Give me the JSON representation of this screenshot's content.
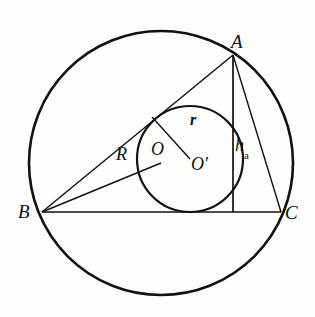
{
  "figure": {
    "background_color": "#fdfdfb",
    "stroke_color": "#111111"
  },
  "labels": {
    "vertex_a": "A",
    "vertex_b": "B",
    "vertex_c": "C",
    "circumcenter": "O",
    "incenter": "O′",
    "circumradius": "R",
    "inradius": "r",
    "altitude_h": "h",
    "altitude_sub": "a"
  },
  "geometry": {
    "circumcircle": {
      "cx": 161,
      "cy": 163,
      "r": 132,
      "stroke_width": 2.6
    },
    "incircle": {
      "cx": 190,
      "cy": 159,
      "r": 53,
      "stroke_width": 2.2
    },
    "points": {
      "A": {
        "x": 233,
        "y": 55
      },
      "B": {
        "x": 42,
        "y": 212
      },
      "C": {
        "x": 281,
        "y": 212
      },
      "O": {
        "x": 161,
        "y": 163
      },
      "Oprime": {
        "x": 190,
        "y": 159
      },
      "foot_of_altitude": {
        "x": 233,
        "y": 212
      },
      "tangent_point_ab": {
        "x": 152,
        "y": 117
      }
    },
    "segments": [
      {
        "name": "side-ab",
        "x1": 42,
        "y1": 212,
        "x2": 233,
        "y2": 55
      },
      {
        "name": "side-bc",
        "x1": 42,
        "y1": 212,
        "x2": 281,
        "y2": 212
      },
      {
        "name": "side-ac",
        "x1": 233,
        "y1": 55,
        "x2": 281,
        "y2": 212
      },
      {
        "name": "circumradius-bo",
        "x1": 42,
        "y1": 212,
        "x2": 161,
        "y2": 163
      },
      {
        "name": "inradius-segment",
        "x1": 152,
        "y1": 117,
        "x2": 190,
        "y2": 159
      },
      {
        "name": "altitude-ha",
        "x1": 233,
        "y1": 55,
        "x2": 233,
        "y2": 212
      }
    ]
  },
  "label_positions": {
    "A": {
      "left": 231,
      "top": 32
    },
    "B": {
      "left": 18,
      "top": 202
    },
    "C": {
      "left": 285,
      "top": 203
    },
    "O": {
      "left": 151,
      "top": 140
    },
    "Oprime": {
      "left": 191,
      "top": 155
    },
    "R": {
      "left": 116,
      "top": 145
    },
    "r": {
      "left": 190,
      "top": 112
    },
    "h": {
      "left": 235,
      "top": 136
    }
  }
}
